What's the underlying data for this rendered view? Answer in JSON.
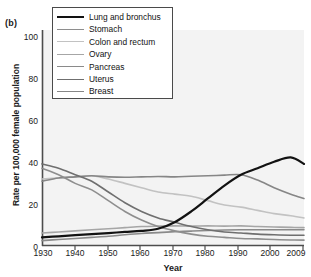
{
  "panel": {
    "label": "(b)"
  },
  "axes": {
    "ylabel": "Rate per 100,000 female population",
    "xlabel": "Year",
    "yticks": [
      "0",
      "20",
      "40",
      "60",
      "80",
      "100"
    ],
    "xticks": [
      "1930",
      "1940",
      "1950",
      "1960",
      "1970",
      "1980",
      "1990",
      "2000",
      "2009"
    ]
  },
  "legend": {
    "items": [
      {
        "label": "Lung and bronchus",
        "color": "#121212",
        "width": 2.2
      },
      {
        "label": "Stomach",
        "color": "#8e8e8e",
        "width": 1.9
      },
      {
        "label": "Colon and rectum",
        "color": "#c2c2c2",
        "width": 1.9
      },
      {
        "label": "Ovary",
        "color": "#a6a6a6",
        "width": 1.9
      },
      {
        "label": "Pancreas",
        "color": "#8a8a8a",
        "width": 1.9
      },
      {
        "label": "Uterus",
        "color": "#6f6f6f",
        "width": 1.9
      },
      {
        "label": "Breast",
        "color": "#868686",
        "width": 1.9
      }
    ]
  },
  "chart_data": {
    "type": "line",
    "title": "",
    "subtitle": "",
    "xlabel": "Year",
    "ylabel": "Rate per 100,000 female population",
    "xlim": [
      1930,
      2009
    ],
    "ylim": [
      0,
      100
    ],
    "grid": false,
    "legend_position": "top-left",
    "annotations": [
      "(b)"
    ],
    "x": [
      1930,
      1935,
      1940,
      1945,
      1950,
      1955,
      1960,
      1965,
      1970,
      1975,
      1980,
      1985,
      1990,
      1995,
      2000,
      2005,
      2009
    ],
    "series": [
      {
        "name": "Lung and bronchus",
        "color": "#121212",
        "values": [
          4,
          4.5,
          5,
          5.5,
          6,
          6.5,
          7,
          8,
          11,
          16,
          22,
          28,
          33,
          36,
          39,
          41,
          38
        ]
      },
      {
        "name": "Stomach",
        "color": "#8e8e8e",
        "values": [
          36,
          33,
          29,
          26,
          21,
          16,
          12,
          9,
          7,
          5.5,
          4.5,
          4,
          3.5,
          3.3,
          3,
          2.8,
          2.7
        ]
      },
      {
        "name": "Colon and rectum",
        "color": "#c2c2c2",
        "values": [
          31,
          31.5,
          32,
          32.5,
          31,
          29,
          27,
          25,
          24,
          23,
          21,
          19,
          18,
          16.5,
          15,
          14,
          13
        ]
      },
      {
        "name": "Ovary",
        "color": "#a6a6a6",
        "values": [
          6,
          6.5,
          7,
          7.5,
          8,
          8.5,
          9,
          9.2,
          9.3,
          9.2,
          9.3,
          9.2,
          9.3,
          9,
          8.8,
          8.6,
          8.5
        ]
      },
      {
        "name": "Pancreas",
        "color": "#8a8a8a",
        "values": [
          2.5,
          3,
          3.5,
          4,
          4.5,
          5.2,
          5.8,
          6.2,
          6.6,
          6.9,
          7.2,
          7.4,
          7.5,
          7.5,
          7.5,
          7.5,
          7.5
        ]
      },
      {
        "name": "Uterus",
        "color": "#6f6f6f",
        "values": [
          38,
          36,
          33,
          30,
          25,
          20,
          16,
          13,
          11,
          9,
          7.5,
          6.5,
          6,
          5.5,
          5.2,
          5,
          5
        ]
      },
      {
        "name": "Breast",
        "color": "#868686",
        "values": [
          30,
          31.5,
          32,
          32.5,
          32,
          31.8,
          32,
          32.2,
          32,
          32.3,
          32.5,
          32.8,
          33,
          30.5,
          27,
          24,
          22
        ]
      }
    ]
  }
}
